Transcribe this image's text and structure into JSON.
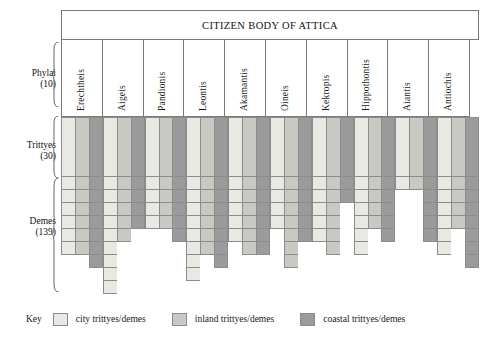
{
  "title": "CITIZEN BODY OF ATTICA",
  "axis": {
    "phylai": {
      "name": "Phylai",
      "count": "(10)"
    },
    "trittyes": {
      "name": "Trittyes",
      "count": "(30)"
    },
    "demes": {
      "name": "Demes",
      "count": "(139)"
    }
  },
  "key": {
    "label": "Key",
    "items": [
      {
        "swatch_name": "city-swatch",
        "color": "#e9e9e4",
        "label": "city trittyes/demes"
      },
      {
        "swatch_name": "inland-swatch",
        "color": "#c9c9c4",
        "label": "inland trittyes/demes"
      },
      {
        "swatch_name": "coastal-swatch",
        "color": "#9b9b9b",
        "label": "coastal trittyes/demes"
      }
    ]
  },
  "chart_data": {
    "type": "bar",
    "title": "CITIZEN BODY OF ATTICA",
    "xlabel": "Phylai (10)",
    "ylabel": "Demes (139)",
    "grid": true,
    "legend_position": "bottom",
    "categories": [
      "Erechtheis",
      "Aigeis",
      "Pandionis",
      "Leontis",
      "Akamantis",
      "Oineis",
      "Kekropis",
      "Hippothontis",
      "Aiantis",
      "Antiochis"
    ],
    "series": [
      {
        "name": "city trittyes/demes",
        "color": "#e9e9e4",
        "values": [
          6,
          9,
          4,
          8,
          5,
          4,
          5,
          6,
          1,
          6
        ]
      },
      {
        "name": "inland trittyes/demes",
        "color": "#c9c9c4",
        "values": [
          6,
          5,
          4,
          6,
          6,
          7,
          6,
          4,
          1,
          4
        ]
      },
      {
        "name": "coastal trittyes/demes",
        "color": "#9b9b9b",
        "values": [
          7,
          4,
          5,
          7,
          6,
          5,
          2,
          5,
          5,
          7
        ]
      }
    ],
    "bars": [
      {
        "phyle": "Erechtheis",
        "trittyes": [
          {
            "type": "city",
            "demes": 6
          },
          {
            "type": "inland",
            "demes": 6
          },
          {
            "type": "coastal",
            "demes": 7
          }
        ]
      },
      {
        "phyle": "Aigeis",
        "trittyes": [
          {
            "type": "city",
            "demes": 9
          },
          {
            "type": "inland",
            "demes": 5
          },
          {
            "type": "coastal",
            "demes": 4
          }
        ]
      },
      {
        "phyle": "Pandionis",
        "trittyes": [
          {
            "type": "city",
            "demes": 4
          },
          {
            "type": "inland",
            "demes": 4
          },
          {
            "type": "coastal",
            "demes": 5
          }
        ]
      },
      {
        "phyle": "Leontis",
        "trittyes": [
          {
            "type": "city",
            "demes": 8
          },
          {
            "type": "inland",
            "demes": 6
          },
          {
            "type": "coastal",
            "demes": 7
          }
        ]
      },
      {
        "phyle": "Akamantis",
        "trittyes": [
          {
            "type": "city",
            "demes": 5
          },
          {
            "type": "inland",
            "demes": 6
          },
          {
            "type": "coastal",
            "demes": 6
          }
        ]
      },
      {
        "phyle": "Oineis",
        "trittyes": [
          {
            "type": "city",
            "demes": 4
          },
          {
            "type": "inland",
            "demes": 7
          },
          {
            "type": "coastal",
            "demes": 5
          }
        ]
      },
      {
        "phyle": "Kekropis",
        "trittyes": [
          {
            "type": "city",
            "demes": 5
          },
          {
            "type": "inland",
            "demes": 6
          },
          {
            "type": "coastal",
            "demes": 2
          }
        ]
      },
      {
        "phyle": "Hippothontis",
        "trittyes": [
          {
            "type": "city",
            "demes": 6
          },
          {
            "type": "inland",
            "demes": 4
          },
          {
            "type": "coastal",
            "demes": 5
          }
        ]
      },
      {
        "phyle": "Aiantis",
        "trittyes": [
          {
            "type": "city",
            "demes": 1
          },
          {
            "type": "inland",
            "demes": 1
          },
          {
            "type": "coastal",
            "demes": 5
          }
        ]
      },
      {
        "phyle": "Antiochis",
        "trittyes": [
          {
            "type": "city",
            "demes": 6
          },
          {
            "type": "inland",
            "demes": 4
          },
          {
            "type": "coastal",
            "demes": 7
          }
        ]
      }
    ]
  }
}
